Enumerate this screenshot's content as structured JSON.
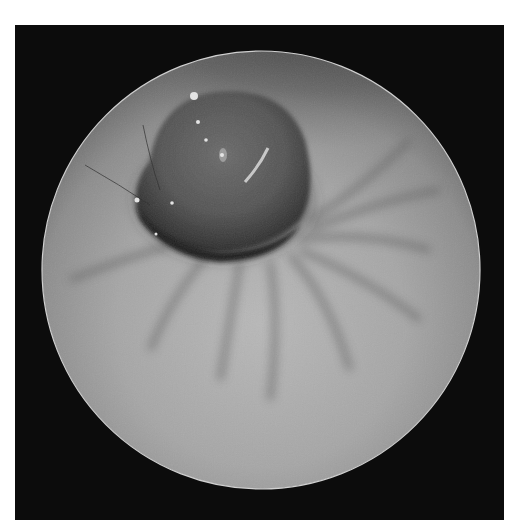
{
  "image": {
    "kind": "endoscopic view",
    "color_mode": "grayscale",
    "description": "Circular endoscope field of view on black background showing a dark rounded lesion at upper center with radiating mucosal folds below",
    "colors": {
      "page_background": "#ffffff",
      "frame_background": "#0c0c0c",
      "mucosa_light": "#b4b4b4",
      "mucosa_mid": "#8a8a8a",
      "lesion_dark": "#3a3a3a",
      "lesion_core": "#5a5a5a",
      "highlight": "#e8e8e8"
    }
  }
}
